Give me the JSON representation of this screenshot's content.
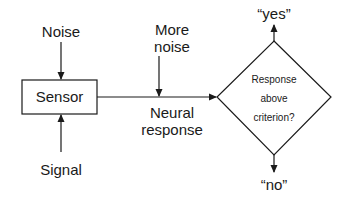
{
  "diagram": {
    "type": "flowchart",
    "nodes": {
      "noise": {
        "label": "Noise"
      },
      "more_noise": {
        "line1": "More",
        "line2": "noise"
      },
      "sensor": {
        "label": "Sensor"
      },
      "signal": {
        "label": "Signal"
      },
      "neural_response": {
        "line1": "Neural",
        "line2": "response"
      },
      "decision": {
        "line1": "Response",
        "line2": "above",
        "line3": "criterion?"
      },
      "yes": {
        "label": "“yes”"
      },
      "no": {
        "label": "“no”"
      }
    },
    "edges": [
      {
        "from": "Noise",
        "to": "Sensor"
      },
      {
        "from": "Signal",
        "to": "Sensor"
      },
      {
        "from": "Sensor",
        "to": "Response above criterion?",
        "label": "Neural response"
      },
      {
        "from": "More noise",
        "to": "Neural response line"
      },
      {
        "from": "Response above criterion?",
        "to": "“yes”"
      },
      {
        "from": "Response above criterion?",
        "to": "“no”"
      }
    ],
    "colors": {
      "line": "#1a1a1a",
      "background": "#ffffff"
    }
  }
}
